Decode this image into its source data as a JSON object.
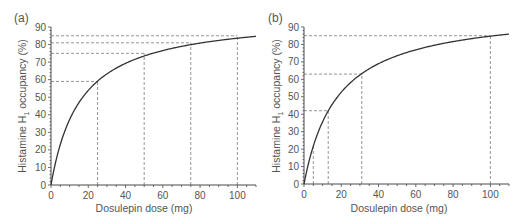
{
  "chart_data": [
    {
      "panel_label": "(a)",
      "type": "line",
      "title": "",
      "xlabel": "Dosulepin dose (mg)",
      "ylabel": "Histamine H1 occupancy (%)",
      "xlim": [
        0,
        110
      ],
      "ylim": [
        0,
        90
      ],
      "xticks": [
        0,
        20,
        40,
        60,
        80,
        100
      ],
      "yticks": [
        0,
        10,
        20,
        30,
        40,
        50,
        60,
        70,
        80,
        90
      ],
      "grid": false,
      "legend": null,
      "curve": {
        "model": "Emax hyperbola",
        "emax": 97,
        "ed50": 16,
        "x": [
          0,
          5,
          10,
          15,
          20,
          25,
          30,
          40,
          50,
          60,
          70,
          75,
          80,
          90,
          100,
          110
        ],
        "y": [
          0,
          23.1,
          37.3,
          46.9,
          53.9,
          59.1,
          63.3,
          69.3,
          73.5,
          76.6,
          79.0,
          79.9,
          80.8,
          82.4,
          83.6,
          84.7
        ]
      },
      "reference_lines": [
        {
          "dose": 25,
          "occupancy": 59
        },
        {
          "dose": 50,
          "occupancy": 75
        },
        {
          "dose": 75,
          "occupancy": 81
        },
        {
          "dose": 100,
          "occupancy": 85
        }
      ]
    },
    {
      "panel_label": "(b)",
      "type": "line",
      "title": "",
      "xlabel": "Dosulepin dose (mg)",
      "ylabel": "Histamine H1 occupancy (%)",
      "xlim": [
        0,
        110
      ],
      "ylim": [
        0,
        90
      ],
      "xticks": [
        0,
        20,
        40,
        60,
        80,
        100
      ],
      "yticks": [
        0,
        10,
        20,
        30,
        40,
        50,
        60,
        70,
        80,
        90
      ],
      "grid": false,
      "legend": null,
      "curve": {
        "model": "Emax hyperbola",
        "emax": 100,
        "ed50": 18,
        "x": [
          0,
          5,
          10,
          13,
          15,
          20,
          25,
          31,
          40,
          50,
          60,
          70,
          80,
          90,
          100,
          110
        ],
        "y": [
          0,
          21.7,
          35.7,
          41.9,
          45.5,
          52.6,
          58.1,
          63.3,
          69.0,
          73.5,
          76.9,
          79.5,
          81.6,
          83.3,
          84.7,
          85.9
        ]
      },
      "reference_lines": [
        {
          "dose": 5,
          "occupancy": null
        },
        {
          "dose": 13,
          "occupancy": 42
        },
        {
          "dose": 31,
          "occupancy": 63
        },
        {
          "dose": 100,
          "occupancy": 85
        }
      ]
    }
  ],
  "panels": {
    "a": {
      "label": "(a)",
      "xlabel": "Dosulepin dose (mg)",
      "ylabel_main": "Histamine H",
      "ylabel_sub": "1",
      "ylabel_tail": " occupancy (%)"
    },
    "b": {
      "label": "(b)",
      "xlabel": "Dosulepin dose (mg)",
      "ylabel_main": "Histamine H",
      "ylabel_sub": "1",
      "ylabel_tail": " occupancy (%)"
    }
  },
  "style": {
    "axis_color": "#4a4a4a",
    "curve_color": "#333333",
    "dash_color": "#7a7a7a"
  }
}
